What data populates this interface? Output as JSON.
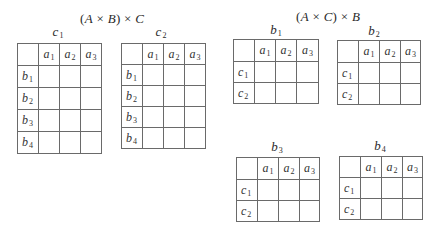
{
  "left_group": {
    "title": {
      "open": "(",
      "a": "A",
      "times1": " × ",
      "b": "B",
      "close": ")",
      "times2": " × ",
      "c": "C"
    },
    "tables": [
      {
        "label": {
          "base": "c",
          "sub": "1"
        },
        "columns": [
          {
            "base": "a",
            "sub": "1"
          },
          {
            "base": "a",
            "sub": "2"
          },
          {
            "base": "a",
            "sub": "3"
          }
        ],
        "rows": [
          {
            "base": "b",
            "sub": "1"
          },
          {
            "base": "b",
            "sub": "2"
          },
          {
            "base": "b",
            "sub": "3"
          },
          {
            "base": "b",
            "sub": "4"
          }
        ]
      },
      {
        "label": {
          "base": "c",
          "sub": "2"
        },
        "columns": [
          {
            "base": "a",
            "sub": "1"
          },
          {
            "base": "a",
            "sub": "2"
          },
          {
            "base": "a",
            "sub": "3"
          }
        ],
        "rows": [
          {
            "base": "b",
            "sub": "1"
          },
          {
            "base": "b",
            "sub": "2"
          },
          {
            "base": "b",
            "sub": "3"
          },
          {
            "base": "b",
            "sub": "4"
          }
        ]
      }
    ]
  },
  "right_group": {
    "title": {
      "open": "(",
      "a": "A",
      "times1": " × ",
      "b": "C",
      "close": ")",
      "times2": " × ",
      "c": "B"
    },
    "tables": [
      {
        "label": {
          "base": "b",
          "sub": "1"
        },
        "columns": [
          {
            "base": "a",
            "sub": "1"
          },
          {
            "base": "a",
            "sub": "2"
          },
          {
            "base": "a",
            "sub": "3"
          }
        ],
        "rows": [
          {
            "base": "c",
            "sub": "1"
          },
          {
            "base": "c",
            "sub": "2"
          }
        ]
      },
      {
        "label": {
          "base": "b",
          "sub": "2"
        },
        "columns": [
          {
            "base": "a",
            "sub": "1"
          },
          {
            "base": "a",
            "sub": "2"
          },
          {
            "base": "a",
            "sub": "3"
          }
        ],
        "rows": [
          {
            "base": "c",
            "sub": "1"
          },
          {
            "base": "c",
            "sub": "2"
          }
        ]
      },
      {
        "label": {
          "base": "b",
          "sub": "3"
        },
        "columns": [
          {
            "base": "a",
            "sub": "1"
          },
          {
            "base": "a",
            "sub": "2"
          },
          {
            "base": "a",
            "sub": "3"
          }
        ],
        "rows": [
          {
            "base": "c",
            "sub": "1"
          },
          {
            "base": "c",
            "sub": "2"
          }
        ]
      },
      {
        "label": {
          "base": "b",
          "sub": "4"
        },
        "columns": [
          {
            "base": "a",
            "sub": "1"
          },
          {
            "base": "a",
            "sub": "2"
          },
          {
            "base": "a",
            "sub": "3"
          }
        ],
        "rows": [
          {
            "base": "c",
            "sub": "1"
          },
          {
            "base": "c",
            "sub": "2"
          }
        ]
      }
    ]
  }
}
